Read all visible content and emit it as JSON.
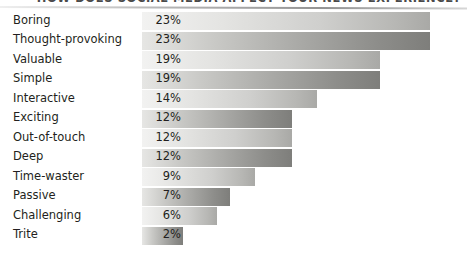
{
  "chart_data": {
    "type": "bar",
    "orientation": "horizontal",
    "title": "HOW DOES SOCIAL MEDIA AFFECT YOUR NEWS EXPERIENCE?",
    "xlabel": "",
    "ylabel": "",
    "xlim": [
      0,
      26
    ],
    "grid": false,
    "legend": false,
    "value_suffix": "%",
    "categories": [
      "Boring",
      "Thought-provoking",
      "Valuable",
      "Simple",
      "Interactive",
      "Exciting",
      "Out-of-touch",
      "Deep",
      "Time-waster",
      "Passive",
      "Challenging",
      "Trite"
    ],
    "values": [
      23,
      23,
      19,
      19,
      14,
      12,
      12,
      12,
      9,
      7,
      6,
      2
    ],
    "value_labels": [
      "23%",
      "23%",
      "19%",
      "19%",
      "14%",
      "12%",
      "12%",
      "12%",
      "9%",
      "7%",
      "6%",
      "2%"
    ],
    "colors": {
      "bar_light_start": "#f2f2f1",
      "bar_light_end": "#a9a9a6",
      "bar_dark_start": "#e6e6e4",
      "bar_dark_end": "#7e7e7b",
      "text": "#231f20",
      "rule": "#8a8a8a",
      "background": "#ffffff"
    }
  }
}
